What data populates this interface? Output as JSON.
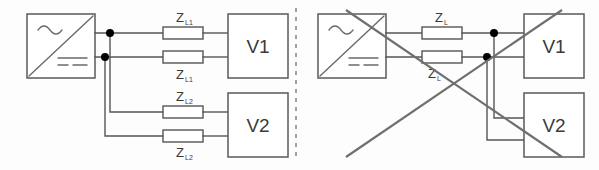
{
  "figure": {
    "background_color": "#fdfdfd",
    "line_color": "#555555",
    "dot_color": "#000000",
    "cross_color": "#6f6f6f",
    "divider_color": "#8a8a8a"
  },
  "panels": [
    {
      "id": "left",
      "status": "valid",
      "marked_invalid": false,
      "source": {
        "type": "inverter",
        "ac_symbol": "~",
        "dc_symbol": "= =",
        "label": ""
      },
      "loads": [
        {
          "name": "V1",
          "label": "V1"
        },
        {
          "name": "V2",
          "label": "V2"
        }
      ],
      "impedances": [
        {
          "symbol": "Z",
          "subscript": "L1",
          "position": "top-upper"
        },
        {
          "symbol": "Z",
          "subscript": "L1",
          "position": "top-lower"
        },
        {
          "symbol": "Z",
          "subscript": "L2",
          "position": "bottom-upper"
        },
        {
          "symbol": "Z",
          "subscript": "L2",
          "position": "bottom-lower"
        }
      ],
      "junction_dots": 2
    },
    {
      "id": "right",
      "status": "invalid",
      "marked_invalid": true,
      "source": {
        "type": "inverter",
        "ac_symbol": "~",
        "dc_symbol": "= =",
        "label": ""
      },
      "loads": [
        {
          "name": "V1",
          "label": "V1"
        },
        {
          "name": "V2",
          "label": "V2"
        }
      ],
      "impedances": [
        {
          "symbol": "Z",
          "subscript": "L",
          "position": "upper"
        },
        {
          "symbol": "Z",
          "subscript": "L",
          "position": "lower"
        }
      ],
      "junction_dots": 2
    }
  ]
}
